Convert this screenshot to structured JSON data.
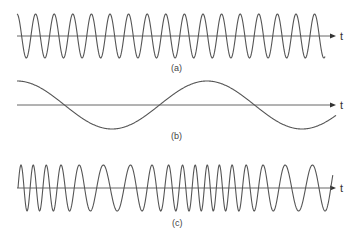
{
  "figure": {
    "colors": {
      "wave": "#555555",
      "axis": "#555555",
      "text": "#444444",
      "background": "#ffffff"
    },
    "panels": [
      {
        "id": "a",
        "label": "(a)",
        "description": "Carrier wave",
        "axis_label": "t",
        "axis_y": 36,
        "x_start": 17,
        "x_end": 325,
        "amplitude": 22,
        "period_px": 18.6,
        "start_phase": "peak",
        "label_pos": [
          177,
          71
        ]
      },
      {
        "id": "b",
        "label": "(b)",
        "description": "Modulating signal",
        "axis_label": "t",
        "axis_y": 105,
        "x_start": 17,
        "x_end": 336,
        "amplitude": 24,
        "period_px": 190,
        "start_phase": "peak",
        "label_pos": [
          177,
          139
        ]
      },
      {
        "id": "c",
        "label": "(c)",
        "description": "Frequency-modulated wave",
        "axis_label": "t",
        "axis_y": 188,
        "x_start": 18,
        "x_end": 333,
        "amplitude": 23,
        "freq_min_period_px": 28,
        "freq_max_period_px": 12,
        "label_pos": [
          178,
          226
        ]
      }
    ],
    "axis": {
      "x_start": 17,
      "arrow_tip_x": 336,
      "t_label_x": 340
    }
  },
  "chart_data": {
    "type": "line",
    "title": "",
    "xlabel": "t",
    "ylabel": "",
    "series": [
      {
        "name": "(a) carrier",
        "function": "A*cos(2*pi*fc*t)",
        "cycles_shown": 16.5
      },
      {
        "name": "(b) modulating signal",
        "function": "cos(2*pi*fm*t)",
        "cycles_shown": 1.7
      },
      {
        "name": "(c) FM wave",
        "function": "A*cos(2*pi*fc*t + beta*sin(2*pi*fm*t))",
        "note": "frequency highest at peaks of (b), lowest at troughs of (b)"
      }
    ],
    "grid": false,
    "legend": "none"
  }
}
